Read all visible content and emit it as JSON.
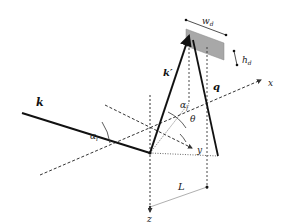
{
  "diagram": {
    "labels": {
      "incident_wavevector": "k",
      "scattered_wavevector": "k′",
      "scattering_vector": "q",
      "incidence_angle": "αᵢ",
      "exit_angle": "αf",
      "in_plane_angle": "θ",
      "axis_x": "x",
      "axis_y": "y",
      "axis_z": "z",
      "detector_width": "w",
      "detector_width_sub": "d",
      "detector_height": "h",
      "detector_height_sub": "d",
      "distance": "L"
    },
    "colors": {
      "vector": "#111111",
      "axis": "#333333",
      "detector_fill": "#a8a8a8",
      "distance_line": "#b0b0b0"
    }
  }
}
